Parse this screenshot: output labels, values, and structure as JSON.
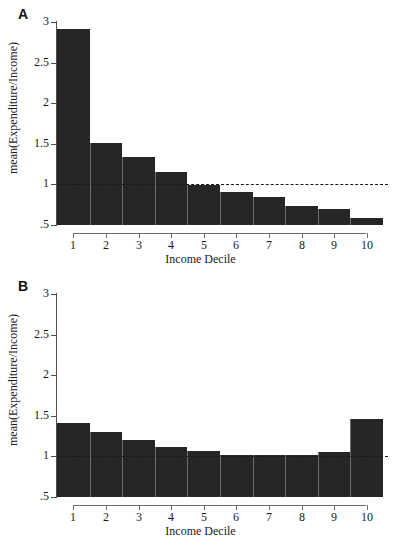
{
  "figure": {
    "xlabel": "Income Decile",
    "ylabel": "mean(Expenditure/Income)"
  },
  "panels": [
    {
      "id": "A",
      "label": "A"
    },
    {
      "id": "B",
      "label": "B"
    }
  ],
  "axis": {
    "y_ticks": [
      "3",
      "2.5",
      "2",
      "1.5",
      "1",
      ".5"
    ],
    "y_tick_values": [
      3,
      2.5,
      2,
      1.5,
      1,
      0.5
    ],
    "x_ticks": [
      "1",
      "2",
      "3",
      "4",
      "5",
      "6",
      "7",
      "8",
      "9",
      "10"
    ]
  },
  "colors": {
    "bar": "#262626",
    "bar_edge": "#6e6e6e",
    "axis": "#4d4d4d",
    "refline": "#1a1a1a",
    "background": "#ffffff"
  },
  "chart_data": [
    {
      "type": "bar",
      "panel": "A",
      "title": "A",
      "xlabel": "Income Decile",
      "ylabel": "mean(Expenditure/Income)",
      "categories": [
        "1",
        "2",
        "3",
        "4",
        "5",
        "6",
        "7",
        "8",
        "9",
        "10"
      ],
      "values": [
        2.92,
        1.51,
        1.34,
        1.15,
        0.99,
        0.91,
        0.84,
        0.74,
        0.7,
        0.59
      ],
      "ylim": [
        0.5,
        3
      ],
      "yticks": [
        0.5,
        1,
        1.5,
        2,
        2.5,
        3
      ],
      "grid": false,
      "legend": false,
      "annotations": [
        {
          "type": "hline",
          "value": 1.0,
          "style": "dashed",
          "label": ""
        }
      ]
    },
    {
      "type": "bar",
      "panel": "B",
      "title": "B",
      "xlabel": "Income Decile",
      "ylabel": "mean(Expenditure/Income)",
      "categories": [
        "1",
        "2",
        "3",
        "4",
        "5",
        "6",
        "7",
        "8",
        "9",
        "10"
      ],
      "values": [
        1.41,
        1.3,
        1.2,
        1.12,
        1.07,
        1.02,
        1.02,
        1.02,
        1.05,
        1.46
      ],
      "ylim": [
        0.5,
        3
      ],
      "yticks": [
        0.5,
        1,
        1.5,
        2,
        2.5,
        3
      ],
      "grid": false,
      "legend": false,
      "annotations": [
        {
          "type": "hline",
          "value": 1.0,
          "style": "dashed",
          "label": ""
        }
      ]
    }
  ]
}
